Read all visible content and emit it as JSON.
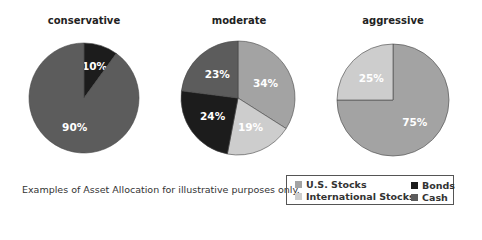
{
  "chart_data": [
    {
      "type": "pie",
      "title": "conservative",
      "labels": [
        "Cash",
        "Bonds"
      ],
      "values": [
        90,
        10
      ],
      "value_labels": [
        "90%",
        "10%"
      ]
    },
    {
      "type": "pie",
      "title": "moderate",
      "labels": [
        "U.S. Stocks",
        "International Stocks",
        "Bonds",
        "Cash"
      ],
      "values": [
        34,
        19,
        24,
        23
      ],
      "value_labels": [
        "34%",
        "19%",
        "24%",
        "23%"
      ]
    },
    {
      "type": "pie",
      "title": "aggressive",
      "labels": [
        "U.S. Stocks",
        "International Stocks"
      ],
      "values": [
        75,
        25
      ],
      "value_labels": [
        "75%",
        "25%"
      ]
    }
  ],
  "legend": {
    "items": [
      {
        "label": "U.S. Stocks",
        "color": "#a3a3a3"
      },
      {
        "label": "International Stocks",
        "color": "#cdcdcd"
      },
      {
        "label": "Bonds",
        "color": "#1c1c1c"
      },
      {
        "label": "Cash",
        "color": "#5c5c5c"
      }
    ]
  },
  "caption": "Examples of Asset Allocation for illustrative purposes only.",
  "colors": {
    "us_stocks": "#a3a3a3",
    "international_stocks": "#cdcdcd",
    "bonds": "#1c1c1c",
    "cash": "#5c5c5c",
    "slice_label": "#ffffff"
  }
}
